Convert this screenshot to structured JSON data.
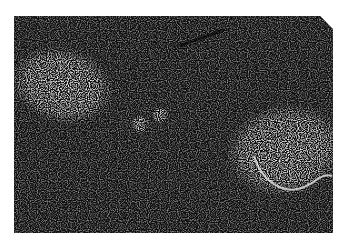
{
  "image": {
    "description": "Grayscale fluorescence micrograph of tissue section with speckled signal",
    "background_color": "#ffffff",
    "field_color": "#0c0c0c",
    "regions": [
      {
        "name": "bright-cluster-left",
        "cx": 62,
        "cy": 85,
        "rx": 50,
        "ry": 40
      },
      {
        "name": "bright-cluster-right",
        "cx": 285,
        "cy": 150,
        "rx": 55,
        "ry": 45
      },
      {
        "name": "small-spot-center-a",
        "cx": 140,
        "cy": 124,
        "r": 9
      },
      {
        "name": "small-spot-center-b",
        "cx": 160,
        "cy": 115,
        "r": 8
      }
    ],
    "curved_filament": "bright arc along lower edge of right cluster"
  }
}
